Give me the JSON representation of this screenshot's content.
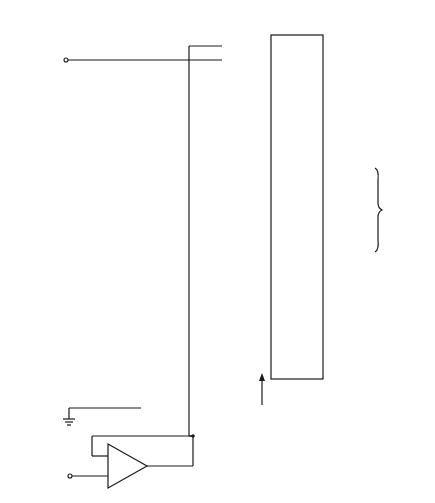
{
  "diagram": {
    "type": "flash-adc-schematic",
    "labels": {
      "reference_voltage": [
        "Reference",
        "voltage"
      ],
      "voltage_divider": [
        "Precision",
        "voltage",
        "divider"
      ],
      "comparators": "Comparators",
      "priority_encoder": [
        "Priority",
        "encoder"
      ],
      "binary_outputs": [
        "Binary",
        "digital",
        "outputs"
      ],
      "decimal_outputs": [
        "Decimal",
        "digital",
        "outputs"
      ],
      "analog_input": [
        "Analog",
        "input",
        "voltage"
      ],
      "buffer": "Buffer",
      "minus": "−",
      "plus": "+"
    },
    "resistors": [
      "1K",
      "1K",
      "1K",
      "1K",
      "1K",
      "1K",
      "1K",
      "1K",
      "1K",
      "1K",
      "1K"
    ],
    "comparator_numbers": [
      "10",
      "9",
      "8",
      "7",
      "6",
      "5",
      "4",
      "3",
      "2",
      "1"
    ],
    "binary_output_weights": [
      "8",
      "4",
      "2",
      "1"
    ]
  }
}
